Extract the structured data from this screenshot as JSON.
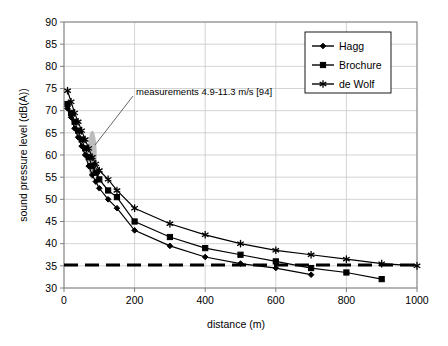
{
  "chart_data": {
    "type": "line",
    "title": "",
    "xlabel": "distance (m)",
    "ylabel": "sound pressure level (dB(A))",
    "xlim": [
      0,
      1000
    ],
    "ylim": [
      30,
      90
    ],
    "xticks": [
      0,
      200,
      400,
      600,
      800,
      1000
    ],
    "yticks": [
      30,
      35,
      40,
      45,
      50,
      55,
      60,
      65,
      70,
      75,
      80,
      85,
      90
    ],
    "grid": true,
    "legend_position": "top-right",
    "series": [
      {
        "name": "Hagg",
        "marker": "diamond",
        "x": [
          10,
          20,
          30,
          40,
          50,
          60,
          70,
          80,
          90,
          100,
          125,
          150,
          200,
          300,
          400,
          500,
          600,
          700
        ],
        "y": [
          70.5,
          68.5,
          66.0,
          64.0,
          62.0,
          60.0,
          57.5,
          55.5,
          54.0,
          52.5,
          50.0,
          48.0,
          43.0,
          39.5,
          37.0,
          35.5,
          34.5,
          33.0
        ]
      },
      {
        "name": "Brochure",
        "marker": "square",
        "x": [
          10,
          20,
          30,
          40,
          50,
          60,
          70,
          80,
          90,
          100,
          125,
          150,
          200,
          300,
          400,
          500,
          600,
          700,
          800,
          900
        ],
        "y": [
          71.5,
          69.5,
          67.5,
          65.5,
          63.5,
          61.5,
          59.5,
          57.5,
          56.0,
          54.5,
          52.0,
          50.5,
          45.0,
          41.5,
          39.0,
          37.5,
          36.0,
          34.5,
          33.5,
          32.0
        ]
      },
      {
        "name": "de Wolf",
        "marker": "star",
        "x": [
          10,
          20,
          30,
          40,
          50,
          60,
          70,
          80,
          90,
          100,
          125,
          150,
          200,
          300,
          400,
          500,
          600,
          700,
          800,
          900,
          1000
        ],
        "y": [
          74.5,
          72.0,
          69.5,
          67.5,
          65.5,
          63.5,
          61.5,
          59.5,
          58.0,
          56.5,
          54.5,
          52.0,
          48.0,
          44.5,
          42.0,
          40.0,
          38.5,
          37.5,
          36.5,
          35.5,
          35.0
        ]
      }
    ],
    "threshold_line": {
      "label": "",
      "y": 35.2,
      "x_start": 0,
      "x_end": 1000,
      "style": "dashed"
    },
    "annotation": {
      "text": "measurements 4.9-11.3 m/s [94]",
      "marker_shape": "ellipse",
      "marker_x": 80,
      "marker_y_low": 55,
      "marker_y_high": 65
    }
  },
  "legend": {
    "entries": [
      {
        "label": "Hagg"
      },
      {
        "label": "Brochure"
      },
      {
        "label": "de Wolf"
      }
    ]
  },
  "axes": {
    "y_tick_labels": [
      "90",
      "85",
      "80",
      "75",
      "70",
      "65",
      "60",
      "55",
      "50",
      "45",
      "40",
      "35",
      "30"
    ],
    "x_tick_labels": [
      "0",
      "200",
      "400",
      "600",
      "800",
      "1000"
    ]
  },
  "colors": {
    "line": "#000000",
    "grid": "#c8c8c8",
    "axis": "#808080",
    "blob": "#a9a9a9",
    "background": "#ffffff"
  }
}
